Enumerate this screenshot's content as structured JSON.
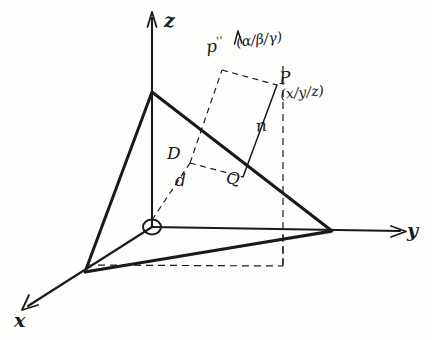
{
  "figure": {
    "ink_color": "#1a1a1a",
    "paper_color": "#fdfdfc"
  },
  "axes": {
    "x_label": "x",
    "y_label": "y",
    "z_label": "z"
  },
  "points": {
    "origin_marker": "O",
    "p_label": "P",
    "p_coords": "(x/y/z)",
    "p_double_prime_label": "p",
    "p_double_prime_primes": "''",
    "p_double_prime_coords": "(α/β/γ)",
    "q_label": "Q"
  },
  "distances": {
    "big_d": "D",
    "small_d": "d",
    "normal_n": "n"
  }
}
